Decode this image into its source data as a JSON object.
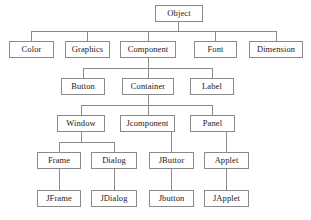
{
  "diagram": {
    "background_color": "#ffffff",
    "box_border_color": "#8a8a8a",
    "line_color": "#8a8a8a",
    "text_color": "#1a1a1a",
    "levels": [
      {
        "level": 1,
        "nodes": [
          {
            "id": "object",
            "label": "Object",
            "x": 155,
            "y": 5,
            "w": 48,
            "h": 17
          }
        ]
      },
      {
        "level": 2,
        "nodes": [
          {
            "id": "color",
            "label": "Color",
            "x": 9,
            "y": 41,
            "w": 45,
            "h": 17
          },
          {
            "id": "graphics",
            "label": "Graphics",
            "x": 65,
            "y": 41,
            "w": 45,
            "h": 17
          },
          {
            "id": "component",
            "label": "Component",
            "x": 120,
            "y": 41,
            "w": 56,
            "h": 17
          },
          {
            "id": "font",
            "label": "Font",
            "x": 194,
            "y": 41,
            "w": 43,
            "h": 17
          },
          {
            "id": "dimension",
            "label": "Dimension",
            "x": 249,
            "y": 41,
            "w": 54,
            "h": 17
          }
        ]
      },
      {
        "level": 3,
        "nodes": [
          {
            "id": "button",
            "label": "Button",
            "x": 61,
            "y": 78,
            "w": 44,
            "h": 17
          },
          {
            "id": "container",
            "label": "Container",
            "x": 122,
            "y": 78,
            "w": 52,
            "h": 17
          },
          {
            "id": "label",
            "label": "Label",
            "x": 190,
            "y": 78,
            "w": 44,
            "h": 17
          }
        ]
      },
      {
        "level": 4,
        "nodes": [
          {
            "id": "window",
            "label": "Window",
            "x": 57,
            "y": 115,
            "w": 48,
            "h": 17
          },
          {
            "id": "jcomponent",
            "label": "Jcomponent",
            "x": 120,
            "y": 115,
            "w": 55,
            "h": 17
          },
          {
            "id": "panel",
            "label": "Panel",
            "x": 190,
            "y": 115,
            "w": 45,
            "h": 17
          }
        ]
      },
      {
        "level": 5,
        "nodes": [
          {
            "id": "frame",
            "label": "Frame",
            "x": 37,
            "y": 152,
            "w": 44,
            "h": 17
          },
          {
            "id": "dialog",
            "label": "Dialog",
            "x": 91,
            "y": 152,
            "w": 46,
            "h": 17
          },
          {
            "id": "jbuttor",
            "label": "JButtor",
            "x": 149,
            "y": 152,
            "w": 45,
            "h": 17
          },
          {
            "id": "applet",
            "label": "Applet",
            "x": 204,
            "y": 152,
            "w": 45,
            "h": 17
          }
        ]
      },
      {
        "level": 6,
        "nodes": [
          {
            "id": "jframe",
            "label": "JFrame",
            "x": 37,
            "y": 190,
            "w": 44,
            "h": 17
          },
          {
            "id": "jdialog",
            "label": "JDialog",
            "x": 91,
            "y": 190,
            "w": 46,
            "h": 17
          },
          {
            "id": "jbutton",
            "label": "Jbutton",
            "x": 149,
            "y": 190,
            "w": 45,
            "h": 17
          },
          {
            "id": "japplet",
            "label": "JApplet",
            "x": 204,
            "y": 190,
            "w": 45,
            "h": 17
          }
        ]
      }
    ],
    "connections": [
      {
        "from": "object",
        "to": "color"
      },
      {
        "from": "object",
        "to": "graphics"
      },
      {
        "from": "object",
        "to": "component"
      },
      {
        "from": "object",
        "to": "font"
      },
      {
        "from": "object",
        "to": "dimension"
      },
      {
        "from": "component",
        "to": "button"
      },
      {
        "from": "component",
        "to": "container"
      },
      {
        "from": "component",
        "to": "label"
      },
      {
        "from": "container",
        "to": "window"
      },
      {
        "from": "container",
        "to": "jcomponent"
      },
      {
        "from": "container",
        "to": "panel"
      },
      {
        "from": "window",
        "to": "frame"
      },
      {
        "from": "window",
        "to": "dialog"
      },
      {
        "from": "jcomponent",
        "to": "jbuttor"
      },
      {
        "from": "panel",
        "to": "applet"
      },
      {
        "from": "frame",
        "to": "jframe"
      },
      {
        "from": "dialog",
        "to": "jdialog"
      },
      {
        "from": "jbuttor",
        "to": "jbutton"
      },
      {
        "from": "applet",
        "to": "japplet"
      }
    ]
  }
}
